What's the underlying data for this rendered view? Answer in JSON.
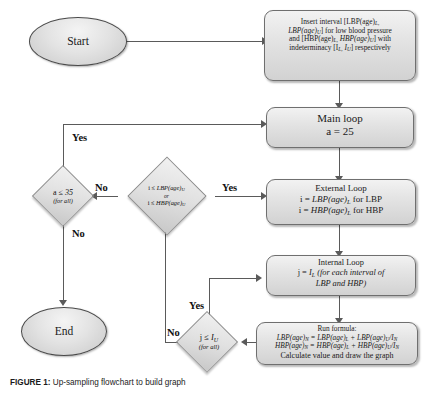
{
  "figure": {
    "caption_label": "FIGURE 1:",
    "caption_text": " Up-sampling flowchart to build graph"
  },
  "nodes": {
    "start": {
      "label": "Start",
      "shape": "oval"
    },
    "end": {
      "label": "End",
      "shape": "oval"
    },
    "insert_interval": {
      "shape": "rounded-rect",
      "line1": "Insert interval [LBP(age)",
      "line1_sub": "L,",
      "line2": "LBP(age)",
      "line2_sub": "U",
      "line2_rest": "] for low blood pressure",
      "line3": "and [HBP(age)",
      "line3_sub": "L,",
      "line3_mid": " HBP(age)",
      "line3_sub2": "U",
      "line3_rest": "] with",
      "line4": "indeterminacy [I",
      "line4_sub": "L,",
      "line4_mid": "  I",
      "line4_sub2": "U",
      "line4_rest": "]  respectively"
    },
    "main_loop": {
      "shape": "rounded-rect",
      "title": "Main loop",
      "body": "a = 25"
    },
    "external_loop": {
      "shape": "rounded-rect",
      "title": "External Loop",
      "line1_pre": "i = ",
      "line1_var": "LBP(age)",
      "line1_sub": "L",
      "line1_post": " for LBP",
      "line2_pre": "i = ",
      "line2_var": "HBP(age)",
      "line2_sub": "L",
      "line2_post": " for HBP"
    },
    "internal_loop": {
      "shape": "rounded-rect",
      "title": "Internal Loop",
      "line1_pre": "j = ",
      "line1_var": "I",
      "line1_sub": "L",
      "line1_post": " (for each interval of",
      "line2": "LBP and HBP)"
    },
    "run_formula": {
      "shape": "rounded-rect",
      "title": "Run formula:",
      "f1_a": "LBP(age)",
      "f1_a_sub": "N",
      "f1_eq": " = LBP(age)",
      "f1_b_sub": "L",
      "f1_plus": " + LBP(age)",
      "f1_c_sub": "U",
      "f1_slash": "/I",
      "f1_d_sub": "N",
      "f2_a": "HBP(age)",
      "f2_a_sub": "N",
      "f2_eq": " = HBP(age)",
      "f2_b_sub": "L",
      "f2_plus": " + HBP(age)",
      "f2_c_sub": "U",
      "f2_slash": "/I",
      "f2_d_sub": "N",
      "f3": "Calculate value and draw the graph"
    }
  },
  "decisions": {
    "a_check": {
      "shape": "diamond",
      "condition_pre": "a ",
      "condition_op": "≤",
      "condition_val": " 35",
      "note": "(for all)"
    },
    "i_check": {
      "shape": "diamond",
      "line1_pre": "i ",
      "line1_op": "≤",
      "line1_var": " LBP(age)",
      "line1_sub": "U",
      "connector": "or",
      "line2_pre": "i ",
      "line2_op": "≤",
      "line2_var": " HBP(age)",
      "line2_sub": "U"
    },
    "j_check": {
      "shape": "diamond",
      "condition_pre": "j ",
      "condition_op": "≤",
      "condition_var": " I",
      "condition_sub": "U",
      "note": "(for all)"
    }
  },
  "edge_labels": {
    "a_check_yes": "Yes",
    "a_check_no": "No",
    "i_check_yes": "Yes",
    "i_check_no": "No",
    "j_check_yes": "Yes",
    "j_check_no": "No"
  },
  "colors": {
    "node_fill_light": "#f2f2f2",
    "node_fill_dark": "#d2d2d2",
    "node_border": "#6f6f6f",
    "connector": "#5a5a5a",
    "text": "#111111",
    "background": "#ffffff"
  }
}
